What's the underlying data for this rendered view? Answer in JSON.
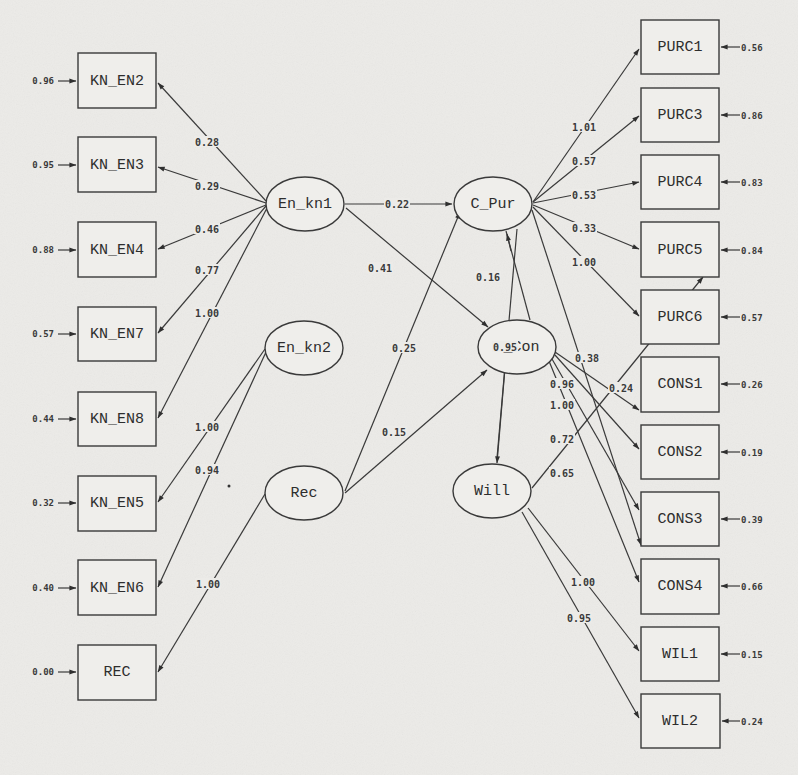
{
  "diagram": {
    "type": "structural-equation-path-diagram",
    "colors": {
      "background": "#ecebe8",
      "stroke": "#3a3a3a",
      "text": "#2d2d2d"
    },
    "observed_left": [
      {
        "id": "KN_EN2",
        "label": "KN_EN2",
        "error": "0.96"
      },
      {
        "id": "KN_EN3",
        "label": "KN_EN3",
        "error": "0.95"
      },
      {
        "id": "KN_EN4",
        "label": "KN_EN4",
        "error": "0.88"
      },
      {
        "id": "KN_EN7",
        "label": "KN_EN7",
        "error": "0.57"
      },
      {
        "id": "KN_EN8",
        "label": "KN_EN8",
        "error": "0.44"
      },
      {
        "id": "KN_EN5",
        "label": "KN_EN5",
        "error": "0.32"
      },
      {
        "id": "KN_EN6",
        "label": "KN_EN6",
        "error": "0.40"
      },
      {
        "id": "REC",
        "label": "REC",
        "error": "0.00"
      }
    ],
    "observed_right": [
      {
        "id": "PURC1",
        "label": "PURC1",
        "error": "0.56"
      },
      {
        "id": "PURC3",
        "label": "PURC3",
        "error": "0.86"
      },
      {
        "id": "PURC4",
        "label": "PURC4",
        "error": "0.83"
      },
      {
        "id": "PURC5",
        "label": "PURC5",
        "error": "0.84"
      },
      {
        "id": "PURC6",
        "label": "PURC6",
        "error": "0.57"
      },
      {
        "id": "CONS1",
        "label": "CONS1",
        "error": "0.26"
      },
      {
        "id": "CONS2",
        "label": "CONS2",
        "error": "0.19"
      },
      {
        "id": "CONS3",
        "label": "CONS3",
        "error": "0.39"
      },
      {
        "id": "CONS4",
        "label": "CONS4",
        "error": "0.66"
      },
      {
        "id": "WIL1",
        "label": "WIL1",
        "error": "0.15"
      },
      {
        "id": "WIL2",
        "label": "WIL2",
        "error": "0.24"
      }
    ],
    "latent": [
      {
        "id": "En_kn1",
        "label": "En_kn1"
      },
      {
        "id": "En_kn2",
        "label": "En_kn2"
      },
      {
        "id": "Rec",
        "label": "Rec"
      },
      {
        "id": "C_Pur",
        "label": "C_Pur"
      },
      {
        "id": "C_Con",
        "label": "C_Con"
      },
      {
        "id": "Will",
        "label": "Will"
      }
    ],
    "loadings": [
      {
        "from": "En_kn1",
        "to": "KN_EN2",
        "value": "0.28"
      },
      {
        "from": "En_kn1",
        "to": "KN_EN3",
        "value": "0.29"
      },
      {
        "from": "En_kn1",
        "to": "KN_EN4",
        "value": "0.46"
      },
      {
        "from": "En_kn1",
        "to": "KN_EN7",
        "value": "0.77"
      },
      {
        "from": "En_kn1",
        "to": "KN_EN8",
        "value": "1.00"
      },
      {
        "from": "En_kn2",
        "to": "KN_EN5",
        "value": "1.00"
      },
      {
        "from": "En_kn2",
        "to": "KN_EN6",
        "value": "0.94"
      },
      {
        "from": "Rec",
        "to": "REC",
        "value": "1.00"
      },
      {
        "from": "C_Pur",
        "to": "PURC1",
        "value": "1.01"
      },
      {
        "from": "C_Pur",
        "to": "PURC3",
        "value": "0.57"
      },
      {
        "from": "C_Pur",
        "to": "PURC4",
        "value": "0.53"
      },
      {
        "from": "C_Pur",
        "to": "PURC5",
        "value": "0.33"
      },
      {
        "from": "C_Pur",
        "to": "PURC6",
        "value": "1.00"
      },
      {
        "from": "C_Con",
        "to": "CONS1",
        "value": "0.96"
      },
      {
        "from": "C_Con",
        "to": "CONS2",
        "value": "1.00"
      },
      {
        "from": "C_Con",
        "to": "CONS3",
        "value": "0.72"
      },
      {
        "from": "C_Con",
        "to": "CONS4",
        "value": "0.65"
      },
      {
        "from": "Will",
        "to": "WIL1",
        "value": "1.00"
      },
      {
        "from": "Will",
        "to": "WIL2",
        "value": "0.95"
      }
    ],
    "structural_paths": [
      {
        "from": "En_kn1",
        "to": "C_Pur",
        "value": "0.22"
      },
      {
        "from": "En_kn1",
        "to": "C_Con",
        "value": "0.41"
      },
      {
        "from": "Rec",
        "to": "C_Pur",
        "value": "0.25"
      },
      {
        "from": "Rec",
        "to": "C_Con",
        "value": "0.15"
      },
      {
        "from": "C_Con",
        "to": "C_Pur",
        "value": "0.16"
      },
      {
        "from": "C_Con",
        "to": "Will",
        "value": "0.95"
      },
      {
        "from": "C_Pur",
        "to": "CONS3",
        "value": "0.38"
      },
      {
        "from": "Will",
        "to": "PURC5",
        "value": "0.24"
      }
    ],
    "cross_label": {
      "value": "0.38"
    }
  }
}
